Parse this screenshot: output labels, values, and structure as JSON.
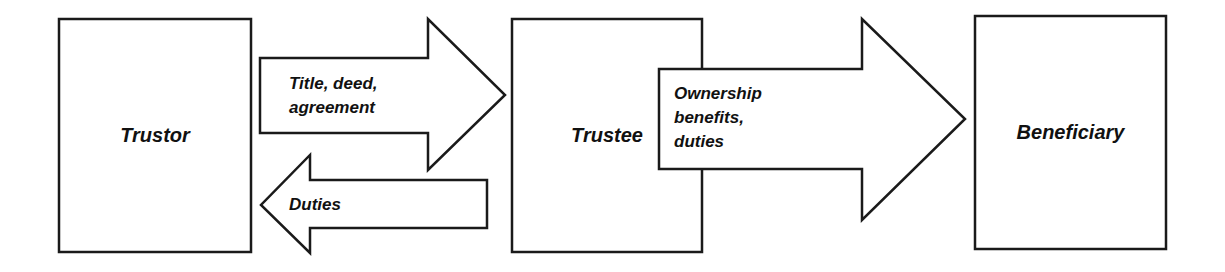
{
  "diagram": {
    "colors": {
      "stroke": "#1a1a1a",
      "fill": "#ffffff",
      "text": "#111111"
    },
    "nodes": [
      {
        "id": "trustor",
        "label": "Trustor"
      },
      {
        "id": "trustee",
        "label": "Trustee"
      },
      {
        "id": "beneficiary",
        "label": "Beneficiary"
      }
    ],
    "edges": [
      {
        "from": "trustor",
        "to": "trustee",
        "direction": "right",
        "label": "Title, deed,\nagreement"
      },
      {
        "from": "trustee",
        "to": "trustor",
        "direction": "left",
        "label": "Duties"
      },
      {
        "from": "trustee",
        "to": "beneficiary",
        "direction": "right",
        "label": "Ownership\nbenefits,\nduties"
      }
    ]
  }
}
